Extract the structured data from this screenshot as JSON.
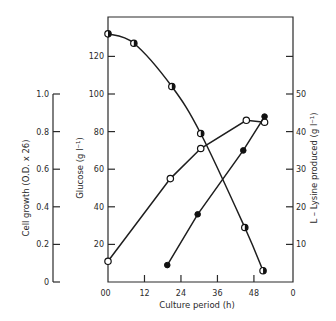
{
  "chart_data": {
    "type": "line",
    "title": "",
    "xlabel": "Culture period (h)",
    "xlim": [
      0,
      60
    ],
    "x_ticks": [
      0,
      12,
      24,
      36,
      48
    ],
    "x_tick_labels": [
      "0",
      "12",
      "24",
      "36",
      "48"
    ],
    "x_right_end_label": "0",
    "axes": [
      {
        "id": "cell_growth",
        "label": "Cell growth (O.D. x 26)",
        "position": "far-left",
        "ylim": [
          0,
          1.0
        ],
        "ticks": [
          0,
          0.2,
          0.4,
          0.6,
          0.8,
          1.0
        ],
        "tick_labels": [
          "0",
          "0.2",
          "0.4",
          "0.6",
          "0.8",
          "1.0"
        ]
      },
      {
        "id": "glucose",
        "label": "Glucose (g l⁻¹)",
        "position": "left",
        "ylim": [
          0,
          140
        ],
        "ticks": [
          20,
          40,
          60,
          80,
          100,
          120
        ],
        "tick_labels": [
          "20",
          "40",
          "60",
          "80",
          "100",
          "120"
        ],
        "zero_label": "0"
      },
      {
        "id": "lysine",
        "label": "L – Lysine produced (g l⁻¹)",
        "position": "right",
        "ylim": [
          0,
          70
        ],
        "ticks": [
          10,
          20,
          30,
          40,
          50,
          60
        ],
        "tick_labels": [
          "10",
          "20",
          "30",
          "40",
          "50",
          ""
        ]
      }
    ],
    "series": [
      {
        "name": "Glucose",
        "axis": "glucose",
        "marker": "half-filled circle",
        "curve": "smooth",
        "x": [
          0,
          8.5,
          21,
          30.5,
          45,
          51
        ],
        "values": [
          132,
          127,
          104,
          79,
          29,
          6
        ]
      },
      {
        "name": "Cell growth",
        "axis": "cell_growth",
        "marker": "open circle",
        "curve": "straight",
        "x": [
          0,
          20.5,
          30.5,
          45.5,
          51.5
        ],
        "values": [
          0.11,
          0.55,
          0.71,
          0.86,
          0.85
        ]
      },
      {
        "name": "L-Lysine produced",
        "axis": "lysine",
        "marker": "filled circle",
        "curve": "straight",
        "x": [
          19.5,
          29.5,
          44.5,
          51.5
        ],
        "values": [
          4.5,
          18,
          35,
          44
        ]
      }
    ],
    "grid": false,
    "legend": "none"
  }
}
